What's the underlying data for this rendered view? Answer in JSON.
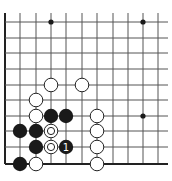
{
  "diagram": {
    "type": "go-board-fragment",
    "colors": {
      "background": "#ffffff",
      "line": "#555555",
      "edge": "#222222",
      "black_stone": "#1a1a1a",
      "white_stone_fill": "#ffffff",
      "white_stone_stroke": "#222222",
      "label_on_black": "#ffffff"
    },
    "grid": {
      "columns_x": [
        5,
        20,
        36,
        51,
        66,
        82,
        97,
        113,
        128,
        143,
        158
      ],
      "rows_y": [
        22,
        38,
        53,
        69,
        85,
        100,
        116,
        131,
        147,
        164
      ],
      "top_extent": 13,
      "right_extent": 168,
      "left_edge": true,
      "bottom_edge": true
    },
    "hoshi": [
      {
        "col": 3,
        "row": 0
      },
      {
        "col": 9,
        "row": 0
      },
      {
        "col": 9,
        "row": 6
      }
    ],
    "stones": [
      {
        "color": "white",
        "col": 3,
        "row": 4
      },
      {
        "color": "white",
        "col": 5,
        "row": 4
      },
      {
        "color": "white",
        "col": 2,
        "row": 5
      },
      {
        "color": "white",
        "col": 2,
        "row": 6
      },
      {
        "color": "black",
        "col": 3,
        "row": 6
      },
      {
        "color": "black",
        "col": 4,
        "row": 6
      },
      {
        "color": "white",
        "col": 6,
        "row": 6
      },
      {
        "color": "black",
        "col": 1,
        "row": 7
      },
      {
        "color": "black",
        "col": 2,
        "row": 7
      },
      {
        "color": "white",
        "col": 3,
        "row": 7,
        "marker": "circle"
      },
      {
        "color": "white",
        "col": 6,
        "row": 7
      },
      {
        "color": "black",
        "col": 2,
        "row": 8
      },
      {
        "color": "white",
        "col": 3,
        "row": 8,
        "marker": "circle"
      },
      {
        "color": "black",
        "col": 4,
        "row": 8,
        "label": "1"
      },
      {
        "color": "white",
        "col": 6,
        "row": 8
      },
      {
        "color": "black",
        "col": 1,
        "row": 9
      },
      {
        "color": "white",
        "col": 2,
        "row": 9
      },
      {
        "color": "white",
        "col": 6,
        "row": 9
      }
    ]
  }
}
